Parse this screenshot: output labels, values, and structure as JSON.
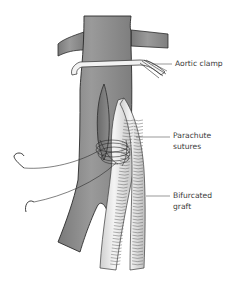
{
  "figure": {
    "labels": {
      "aortic_clamp": "Aortic clamp",
      "parachute_sutures_line1": "Parachute",
      "parachute_sutures_line2": "sutures",
      "bifurcated_graft_line1": "Bifurcated",
      "bifurcated_graft_line2": "graft"
    },
    "colors": {
      "vessel_fill": "#8a8a8a",
      "vessel_outline": "#2b2b2b",
      "graft_fill": "#e4e4e4",
      "clamp_fill": "#f2f2f2",
      "leader_line": "#555555",
      "label_text": "#3a3a3a"
    }
  }
}
